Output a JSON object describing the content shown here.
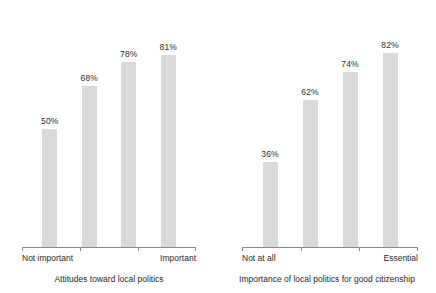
{
  "chart_data": [
    {
      "type": "bar",
      "title": "",
      "xlabel": "Attitudes toward local politics",
      "ylabel": "",
      "ylim": [
        0,
        100
      ],
      "grid": false,
      "legend": "none",
      "categories": [
        "Not important",
        "",
        "",
        "Important"
      ],
      "tick_labels": [
        "Not important",
        "Important"
      ],
      "values": [
        50,
        68,
        78,
        81
      ],
      "data_labels": [
        "50%",
        "68%",
        "78%",
        "81%"
      ],
      "bar_color": "#d9d9d9"
    },
    {
      "type": "bar",
      "title": "",
      "xlabel": "Importance of local politics for good citizenship",
      "ylabel": "",
      "ylim": [
        0,
        100
      ],
      "grid": false,
      "legend": "none",
      "categories": [
        "Not at all",
        "",
        "",
        "Essential"
      ],
      "tick_labels": [
        "Not at all",
        "Essential"
      ],
      "values": [
        36,
        62,
        74,
        82
      ],
      "data_labels": [
        "36%",
        "62%",
        "74%",
        "82%"
      ],
      "bar_color": "#d9d9d9"
    }
  ],
  "panels": [
    {
      "name": "attitudes-panel",
      "axis_title": "Attitudes toward local politics",
      "start_label": "Not important",
      "end_label": "Important",
      "bars": [
        {
          "label": "50%",
          "value": 50
        },
        {
          "label": "68%",
          "value": 68
        },
        {
          "label": "78%",
          "value": 78
        },
        {
          "label": "81%",
          "value": 81
        }
      ]
    },
    {
      "name": "importance-panel",
      "axis_title": "Importance of local politics for good citizenship",
      "start_label": "Not at all",
      "end_label": "Essential",
      "bars": [
        {
          "label": "36%",
          "value": 36
        },
        {
          "label": "62%",
          "value": 62
        },
        {
          "label": "74%",
          "value": 74
        },
        {
          "label": "82%",
          "value": 82
        }
      ]
    }
  ]
}
